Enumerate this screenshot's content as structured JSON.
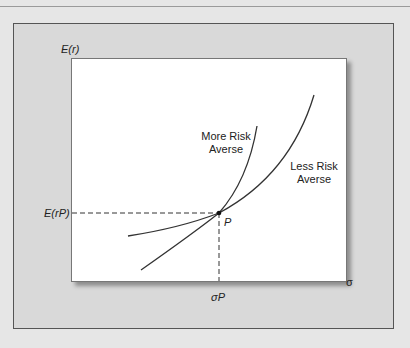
{
  "axes": {
    "y_label": "E(r)",
    "x_label": "σ",
    "y_tick": "E(rP)",
    "x_tick": "σP"
  },
  "point_label": "P",
  "curves": {
    "more_risk_averse": {
      "line1": "More Risk",
      "line2": "Averse"
    },
    "less_risk_averse": {
      "line1": "Less Risk",
      "line2": "Averse"
    }
  }
}
